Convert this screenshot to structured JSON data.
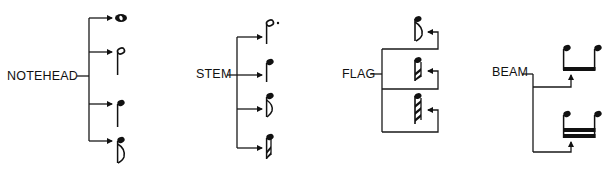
{
  "diagram": {
    "type": "music-notation-parts",
    "groups": [
      {
        "label": "NOTEHEAD",
        "targets": [
          "whole note",
          "half note",
          "quarter note",
          "eighth note"
        ]
      },
      {
        "label": "STEM",
        "targets": [
          "dotted half note",
          "quarter note",
          "eighth note",
          "sixteenth note"
        ]
      },
      {
        "label": "FLAG",
        "targets": [
          "eighth note flag (1 flag)",
          "sixteenth note flags (2 flags)",
          "thirty-second note flags (3 flags)"
        ]
      },
      {
        "label": "BEAM",
        "targets": [
          "single beam (two eighth notes)",
          "double beam (two sixteenth notes)"
        ]
      }
    ]
  },
  "colors": {
    "ink": "#111111",
    "background": "#ffffff"
  }
}
